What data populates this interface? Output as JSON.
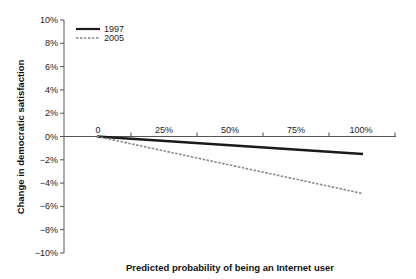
{
  "chart_data": {
    "type": "line",
    "title": "",
    "xlabel": "Predicted probability of being an Internet user",
    "ylabel": "Change in democratic satisfaction",
    "x": [
      0,
      100
    ],
    "x_tick_labels": [
      "0",
      "25%",
      "50%",
      "75%",
      "100%"
    ],
    "y_tick_labels": [
      "10%",
      "8%",
      "6%",
      "4%",
      "2%",
      "0%",
      "−2%",
      "−4%",
      "−6%",
      "−8%",
      "−10%"
    ],
    "ylim": [
      -10,
      10
    ],
    "xlim": [
      0,
      100
    ],
    "grid": false,
    "legend_position": "upper-left",
    "series": [
      {
        "name": "1997",
        "style": "solid",
        "color": "#1a1a1a",
        "values": [
          0,
          -1.5
        ]
      },
      {
        "name": "2005",
        "style": "dashed",
        "color": "#888888",
        "values": [
          0,
          -4.9
        ]
      }
    ]
  },
  "legend": {
    "items": [
      {
        "label": "1997"
      },
      {
        "label": "2005"
      }
    ]
  }
}
